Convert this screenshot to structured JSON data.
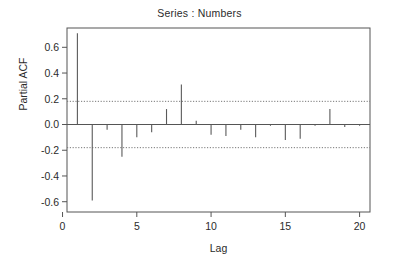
{
  "chart_data": {
    "type": "bar",
    "title": "Series : Numbers",
    "xlabel": "Lag",
    "ylabel": "Partial ACF",
    "grid": false,
    "legend": null,
    "xlim": [
      0.3,
      20.7
    ],
    "ylim": [
      -0.68,
      0.75
    ],
    "xticks": [
      0,
      5,
      10,
      15,
      20
    ],
    "xtick_labels": [
      "0",
      "5",
      "10",
      "15",
      "20"
    ],
    "yticks": [
      -0.6,
      -0.4,
      -0.2,
      0.0,
      0.2,
      0.4,
      0.6
    ],
    "ytick_labels": [
      "-0.6",
      "-0.4",
      "-0.2",
      "0.0",
      "0.2",
      "0.4",
      "0.6"
    ],
    "categories": [
      1,
      2,
      3,
      4,
      5,
      6,
      7,
      8,
      9,
      10,
      11,
      12,
      13,
      14,
      15,
      16,
      17,
      18,
      19,
      20
    ],
    "values": [
      0.71,
      -0.59,
      -0.04,
      -0.25,
      -0.1,
      -0.06,
      0.12,
      0.31,
      0.03,
      -0.08,
      -0.09,
      -0.04,
      -0.1,
      -0.01,
      -0.12,
      -0.11,
      -0.01,
      0.12,
      -0.02,
      -0.01
    ],
    "confidence_bounds": [
      0.18,
      -0.18
    ],
    "confidence_line_style": "dotted",
    "zero_line": 0.0
  },
  "colors": {
    "background": "#ffffff",
    "axis": "#555555",
    "bar": "#5a5a5a",
    "confidence": "#777777",
    "text": "#2b2b2b"
  }
}
